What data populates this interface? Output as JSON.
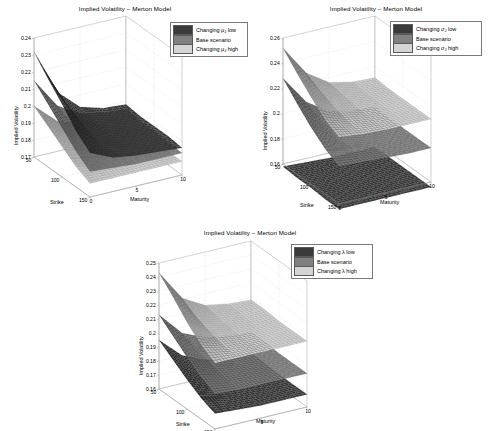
{
  "figure": {
    "background_color": "#ffffff",
    "panel_count": 3
  },
  "palette": {
    "surface_low": "#3a3a3a",
    "surface_base": "#808080",
    "surface_high": "#d4d4d4",
    "axis_line": "#9a9a9a",
    "grid_line": "#cccccc",
    "text": "#000000",
    "legend_border": "#7a7a7a"
  },
  "panels": [
    {
      "id": "panel-1",
      "title": "Implied Volatility – Merton Model",
      "ylabel": "Implied Volatility",
      "xlabel": "Strike",
      "zlabel": "Maturity",
      "legend": [
        {
          "label_pre": "Changing μ",
          "label_sub": "J",
          "label_post": " low",
          "color": "#3a3a3a"
        },
        {
          "label_pre": "Base scenario",
          "label_sub": "",
          "label_post": "",
          "color": "#808080"
        },
        {
          "label_pre": "Changing μ",
          "label_sub": "J",
          "label_post": " high",
          "color": "#d4d4d4"
        }
      ]
    },
    {
      "id": "panel-2",
      "title": "Implied Volatility – Merton Model",
      "ylabel": "Implied Volatility",
      "xlabel": "Strike",
      "zlabel": "Maturity",
      "legend": [
        {
          "label_pre": "Changing σ",
          "label_sub": "J",
          "label_post": " low",
          "color": "#3a3a3a"
        },
        {
          "label_pre": "Base scenario",
          "label_sub": "",
          "label_post": "",
          "color": "#808080"
        },
        {
          "label_pre": "Changing σ",
          "label_sub": "J",
          "label_post": " high",
          "color": "#d4d4d4"
        }
      ]
    },
    {
      "id": "panel-3",
      "title": "Implied Volatility – Merton Model",
      "ylabel": "Implied Volatility",
      "xlabel": "Strike",
      "zlabel": "Maturity",
      "legend": [
        {
          "label_pre": "Changing λ",
          "label_sub": "",
          "label_post": " low",
          "color": "#3a3a3a"
        },
        {
          "label_pre": "Base scenario",
          "label_sub": "",
          "label_post": "",
          "color": "#808080"
        },
        {
          "label_pre": "Changing λ",
          "label_sub": "",
          "label_post": " high",
          "color": "#d4d4d4"
        }
      ]
    }
  ],
  "chart_data": [
    {
      "type": "surface",
      "panel": "panel-1",
      "title": "Implied Volatility – Merton Model",
      "xlabel": "Strike",
      "ylabel": "Maturity",
      "zlabel": "Implied Volatility",
      "projection": "3d",
      "grid": true,
      "legend_position": "upper right",
      "x": [
        50,
        75,
        100,
        125,
        150
      ],
      "xlim": [
        50,
        150
      ],
      "xticks": [
        50,
        100,
        150
      ],
      "y": [
        0,
        2.5,
        5,
        7.5,
        10
      ],
      "ylim": [
        0,
        10
      ],
      "yticks": [
        0,
        5,
        10
      ],
      "zlim": [
        0.17,
        0.24
      ],
      "zticks": [
        0.17,
        0.18,
        0.19,
        0.2,
        0.21,
        0.22,
        0.23,
        0.24
      ],
      "series": [
        {
          "name": "Changing mu_J low",
          "color": "#3a3a3a",
          "z": [
            [
              0.232,
              0.205,
              0.193,
              0.189,
              0.188
            ],
            [
              0.222,
              0.2,
              0.191,
              0.188,
              0.187
            ],
            [
              0.213,
              0.196,
              0.19,
              0.188,
              0.187
            ],
            [
              0.203,
              0.193,
              0.189,
              0.187,
              0.187
            ],
            [
              0.196,
              0.19,
              0.188,
              0.187,
              0.186
            ]
          ]
        },
        {
          "name": "Base scenario",
          "color": "#808080",
          "z": [
            [
              0.215,
              0.197,
              0.189,
              0.186,
              0.185
            ],
            [
              0.207,
              0.193,
              0.187,
              0.185,
              0.184
            ],
            [
              0.199,
              0.19,
              0.186,
              0.184,
              0.184
            ],
            [
              0.191,
              0.187,
              0.185,
              0.184,
              0.183
            ],
            [
              0.185,
              0.184,
              0.183,
              0.183,
              0.183
            ]
          ]
        },
        {
          "name": "Changing mu_J high",
          "color": "#d4d4d4",
          "z": [
            [
              0.2,
              0.188,
              0.183,
              0.181,
              0.18
            ],
            [
              0.194,
              0.185,
              0.181,
              0.18,
              0.179
            ],
            [
              0.188,
              0.183,
              0.18,
              0.179,
              0.179
            ],
            [
              0.182,
              0.18,
              0.179,
              0.179,
              0.178
            ],
            [
              0.178,
              0.178,
              0.178,
              0.178,
              0.178
            ]
          ]
        }
      ]
    },
    {
      "type": "surface",
      "panel": "panel-2",
      "title": "Implied Volatility – Merton Model",
      "xlabel": "Strike",
      "ylabel": "Maturity",
      "zlabel": "Implied Volatility",
      "projection": "3d",
      "grid": true,
      "legend_position": "upper right",
      "x": [
        50,
        75,
        100,
        125,
        150
      ],
      "xlim": [
        50,
        150
      ],
      "xticks": [
        50,
        100,
        150
      ],
      "y": [
        0,
        2.5,
        5,
        7.5,
        10
      ],
      "ylim": [
        0,
        10
      ],
      "yticks": [
        0,
        5,
        10
      ],
      "zlim": [
        0.16,
        0.26
      ],
      "zticks": [
        0.16,
        0.18,
        0.2,
        0.22,
        0.24,
        0.26
      ],
      "series": [
        {
          "name": "Changing sigma_J low",
          "color": "#3a3a3a",
          "z": [
            [
              0.158,
              0.157,
              0.156,
              0.156,
              0.156
            ],
            [
              0.157,
              0.156,
              0.156,
              0.156,
              0.156
            ],
            [
              0.157,
              0.156,
              0.156,
              0.156,
              0.156
            ],
            [
              0.156,
              0.156,
              0.156,
              0.156,
              0.156
            ],
            [
              0.156,
              0.156,
              0.156,
              0.156,
              0.156
            ]
          ]
        },
        {
          "name": "Base scenario",
          "color": "#808080",
          "z": [
            [
              0.228,
              0.205,
              0.193,
              0.189,
              0.188
            ],
            [
              0.216,
              0.199,
              0.191,
              0.188,
              0.187
            ],
            [
              0.205,
              0.195,
              0.19,
              0.188,
              0.187
            ],
            [
              0.196,
              0.191,
              0.189,
              0.188,
              0.187
            ],
            [
              0.19,
              0.189,
              0.188,
              0.187,
              0.187
            ]
          ]
        },
        {
          "name": "Changing sigma_J high",
          "color": "#d4d4d4",
          "z": [
            [
              0.252,
              0.228,
              0.216,
              0.212,
              0.211
            ],
            [
              0.24,
              0.222,
              0.214,
              0.211,
              0.21
            ],
            [
              0.229,
              0.217,
              0.212,
              0.21,
              0.21
            ],
            [
              0.219,
              0.213,
              0.211,
              0.21,
              0.21
            ],
            [
              0.213,
              0.211,
              0.21,
              0.21,
              0.21
            ]
          ]
        }
      ]
    },
    {
      "type": "surface",
      "panel": "panel-3",
      "title": "Implied Volatility – Merton Model",
      "xlabel": "Strike",
      "ylabel": "Maturity",
      "zlabel": "Implied Volatility",
      "projection": "3d",
      "grid": true,
      "legend_position": "upper right",
      "x": [
        50,
        75,
        100,
        125,
        150
      ],
      "xlim": [
        50,
        150
      ],
      "xticks": [
        50,
        100,
        150
      ],
      "y": [
        0,
        2.5,
        5,
        7.5,
        10
      ],
      "ylim": [
        0,
        10
      ],
      "yticks": [
        0,
        5,
        10
      ],
      "zlim": [
        0.16,
        0.25
      ],
      "zticks": [
        0.16,
        0.17,
        0.18,
        0.19,
        0.2,
        0.21,
        0.22,
        0.23,
        0.24,
        0.25
      ],
      "series": [
        {
          "name": "Changing lambda low",
          "color": "#3a3a3a",
          "z": [
            [
              0.195,
              0.18,
              0.173,
              0.171,
              0.17
            ],
            [
              0.188,
              0.177,
              0.172,
              0.17,
              0.17
            ],
            [
              0.181,
              0.174,
              0.171,
              0.17,
              0.169
            ],
            [
              0.175,
              0.171,
              0.17,
              0.169,
              0.169
            ],
            [
              0.171,
              0.17,
              0.169,
              0.169,
              0.169
            ]
          ]
        },
        {
          "name": "Base scenario",
          "color": "#808080",
          "z": [
            [
              0.213,
              0.196,
              0.189,
              0.186,
              0.185
            ],
            [
              0.205,
              0.192,
              0.187,
              0.185,
              0.185
            ],
            [
              0.197,
              0.189,
              0.186,
              0.185,
              0.184
            ],
            [
              0.19,
              0.186,
              0.185,
              0.184,
              0.184
            ],
            [
              0.185,
              0.184,
              0.184,
              0.184,
              0.184
            ]
          ]
        },
        {
          "name": "Changing lambda high",
          "color": "#d4d4d4",
          "z": [
            [
              0.243,
              0.221,
              0.212,
              0.209,
              0.208
            ],
            [
              0.233,
              0.215,
              0.21,
              0.208,
              0.208
            ],
            [
              0.222,
              0.211,
              0.208,
              0.207,
              0.207
            ],
            [
              0.213,
              0.208,
              0.207,
              0.207,
              0.207
            ],
            [
              0.207,
              0.207,
              0.207,
              0.207,
              0.207
            ]
          ]
        }
      ]
    }
  ]
}
